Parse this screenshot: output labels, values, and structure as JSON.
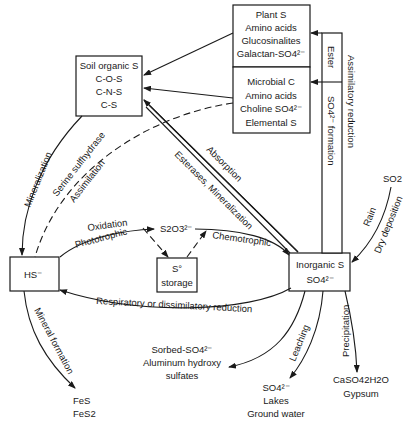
{
  "diagram": {
    "nodes": {
      "plant": {
        "lines": [
          "Plant S",
          "Amino acids",
          "Glucosinalites",
          "Galactan-SO4²⁻"
        ]
      },
      "microbial": {
        "lines": [
          "Microbial C",
          "Amino acids",
          "Choline SO4²⁻",
          "Elemental S"
        ]
      },
      "soil_organic": {
        "lines": [
          "Soil organic S",
          "C-O-S",
          "C-N-S",
          "C-S"
        ]
      },
      "hs": {
        "label": "HS⁻"
      },
      "s_storage": {
        "lines": [
          "S°",
          "storage"
        ]
      },
      "inorganic": {
        "lines": [
          "Inorganic S",
          "SO4²⁻"
        ]
      },
      "thiosulfate": {
        "label": "S2O3²⁻"
      },
      "so2": {
        "label": "SO2"
      },
      "sorbed": {
        "lines": [
          "Sorbed-SO4²⁻",
          "Aluminum hydroxy",
          "sulfates"
        ]
      },
      "fes": {
        "lines": [
          "FeS",
          "FeS2"
        ]
      },
      "leached": {
        "lines": [
          "SO4²⁻",
          "Lakes",
          "Ground water"
        ]
      },
      "gypsum": {
        "lines": [
          "CaSO42H2O",
          "Gypsum"
        ]
      }
    },
    "edge_labels": {
      "ester": "Ester",
      "so4_formation": "SO4²⁻ formation",
      "assimilatory_reduction": "Assimilatory reduction",
      "mineralization": "Mineralization",
      "serine_sulfhydrase": "Serine sulfhydrase",
      "assimilation": "Assimilation",
      "absorption": "Absorption",
      "esterases_mineralization": "Esterases, Mineralization",
      "oxidation": "Oxidation",
      "phototrophic": "Phototrophic",
      "chemotrophic": "Chemotrophic",
      "respiratory": "Respiratory or dissimilatory reduction",
      "rain": "Rain",
      "dry_deposition": "Dry deposition",
      "mineral_formation": "Mineral formation",
      "leaching": "Leaching",
      "precipitation": "Precipitation"
    }
  }
}
